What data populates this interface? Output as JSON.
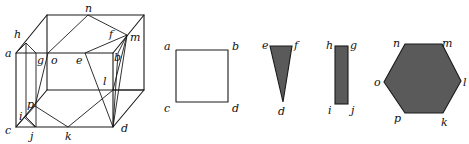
{
  "figure": {
    "cube": {
      "labels": {
        "a": "a",
        "h": "h",
        "g": "g",
        "o": "o",
        "e": "e",
        "n": "n",
        "f": "f",
        "m": "m",
        "b": "b",
        "l": "l",
        "p": "p",
        "i": "i",
        "c": "c",
        "j": "j",
        "k": "k",
        "d": "d"
      }
    },
    "square": {
      "labels": {
        "a": "a",
        "b": "b",
        "c": "c",
        "d": "d"
      }
    },
    "triangle": {
      "labels": {
        "e": "e",
        "f": "f",
        "d": "d"
      },
      "fill": "#5a5a5a"
    },
    "rectangle": {
      "labels": {
        "h": "h",
        "g": "g",
        "i": "i",
        "j": "j"
      },
      "fill": "#5a5a5a"
    },
    "hexagon": {
      "labels": {
        "n": "n",
        "m": "m",
        "o": "o",
        "l": "l",
        "p": "p",
        "k": "k"
      },
      "fill": "#5a5a5a"
    }
  }
}
